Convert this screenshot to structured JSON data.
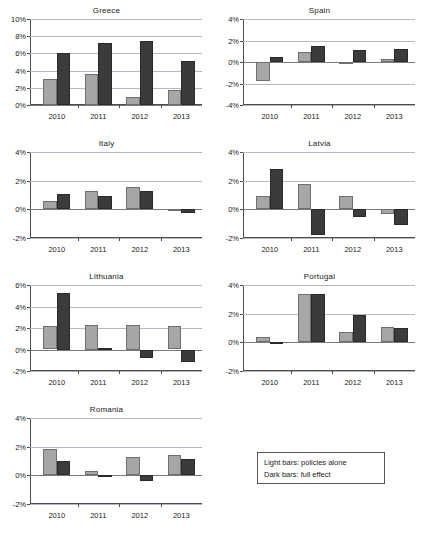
{
  "figure": {
    "legend": {
      "lines": [
        "Light bars: policies alone",
        "Dark bars: full effect"
      ]
    }
  },
  "chart_data": [
    {
      "type": "bar",
      "title": "Greece",
      "xlabel": "",
      "ylabel": "",
      "categories": [
        "2010",
        "2011",
        "2012",
        "2013"
      ],
      "yticks": [
        "0%",
        "2%",
        "4%",
        "6%",
        "8%",
        "10%"
      ],
      "ytick_values": [
        0,
        2,
        4,
        6,
        8,
        10
      ],
      "ylim": [
        0,
        10
      ],
      "grid": true,
      "series": [
        {
          "name": "policies alone",
          "color": "#a6a6a6",
          "values": [
            3.0,
            3.6,
            0.9,
            1.75
          ]
        },
        {
          "name": "full effect",
          "color": "#3b3b3b",
          "values": [
            6.0,
            7.2,
            7.4,
            5.1
          ]
        }
      ]
    },
    {
      "type": "bar",
      "title": "Spain",
      "xlabel": "",
      "ylabel": "",
      "categories": [
        "2010",
        "2011",
        "2012",
        "2013"
      ],
      "yticks": [
        "-4%",
        "-2%",
        "0%",
        "2%",
        "4%"
      ],
      "ytick_values": [
        -4,
        -2,
        0,
        2,
        4
      ],
      "ylim": [
        -4,
        4
      ],
      "grid": true,
      "series": [
        {
          "name": "policies alone",
          "color": "#a6a6a6",
          "values": [
            -1.75,
            0.9,
            -0.15,
            0.25
          ]
        },
        {
          "name": "full effect",
          "color": "#3b3b3b",
          "values": [
            0.5,
            1.5,
            1.1,
            1.2
          ]
        }
      ]
    },
    {
      "type": "bar",
      "title": "Italy",
      "xlabel": "",
      "ylabel": "",
      "categories": [
        "2010",
        "2011",
        "2012",
        "2013"
      ],
      "yticks": [
        "-2%",
        "0%",
        "2%",
        "4%"
      ],
      "ytick_values": [
        -2,
        0,
        2,
        4
      ],
      "ylim": [
        -2,
        4
      ],
      "grid": true,
      "series": [
        {
          "name": "policies alone",
          "color": "#a6a6a6",
          "values": [
            0.6,
            1.3,
            1.55,
            0.05
          ]
        },
        {
          "name": "full effect",
          "color": "#3b3b3b",
          "values": [
            1.05,
            0.9,
            1.25,
            -0.25
          ]
        }
      ]
    },
    {
      "type": "bar",
      "title": "Latvia",
      "xlabel": "",
      "ylabel": "",
      "categories": [
        "2010",
        "2011",
        "2012",
        "2013"
      ],
      "yticks": [
        "-2%",
        "0%",
        "2%",
        "4%"
      ],
      "ytick_values": [
        -2,
        0,
        2,
        4
      ],
      "ylim": [
        -2,
        4
      ],
      "grid": true,
      "series": [
        {
          "name": "policies alone",
          "color": "#a6a6a6",
          "values": [
            0.9,
            1.8,
            0.9,
            -0.3
          ]
        },
        {
          "name": "full effect",
          "color": "#3b3b3b",
          "values": [
            2.8,
            -1.8,
            -0.55,
            -1.1
          ]
        }
      ]
    },
    {
      "type": "bar",
      "title": "Lithuania",
      "xlabel": "",
      "ylabel": "",
      "categories": [
        "2010",
        "2011",
        "2012",
        "2013"
      ],
      "yticks": [
        "-2%",
        "0%",
        "2%",
        "4%",
        "6%"
      ],
      "ytick_values": [
        -2,
        0,
        2,
        4,
        6
      ],
      "ylim": [
        -2,
        6
      ],
      "grid": true,
      "series": [
        {
          "name": "policies alone",
          "color": "#a6a6a6",
          "values": [
            2.2,
            2.25,
            2.25,
            2.2
          ]
        },
        {
          "name": "full effect",
          "color": "#3b3b3b",
          "values": [
            5.25,
            0.15,
            -0.75,
            -1.2
          ]
        }
      ]
    },
    {
      "type": "bar",
      "title": "Portugal",
      "xlabel": "",
      "ylabel": "",
      "categories": [
        "2010",
        "2011",
        "2012",
        "2013"
      ],
      "yticks": [
        "-2%",
        "0%",
        "2%",
        "4%"
      ],
      "ytick_values": [
        -2,
        0,
        2,
        4
      ],
      "ylim": [
        -2,
        4
      ],
      "grid": true,
      "series": [
        {
          "name": "policies alone",
          "color": "#a6a6a6",
          "values": [
            0.35,
            3.4,
            0.75,
            1.1
          ]
        },
        {
          "name": "full effect",
          "color": "#3b3b3b",
          "values": [
            -0.05,
            3.35,
            1.9,
            1.0
          ]
        }
      ]
    },
    {
      "type": "bar",
      "title": "Romania",
      "xlabel": "",
      "ylabel": "",
      "categories": [
        "2010",
        "2011",
        "2012",
        "2013"
      ],
      "yticks": [
        "-2%",
        "0%",
        "2%",
        "4%"
      ],
      "ytick_values": [
        -2,
        0,
        2,
        4
      ],
      "ylim": [
        -2,
        4
      ],
      "grid": true,
      "series": [
        {
          "name": "policies alone",
          "color": "#a6a6a6",
          "values": [
            1.85,
            0.3,
            1.3,
            1.4
          ]
        },
        {
          "name": "full effect",
          "color": "#3b3b3b",
          "values": [
            1.0,
            0.03,
            -0.4,
            1.15
          ]
        }
      ]
    }
  ]
}
